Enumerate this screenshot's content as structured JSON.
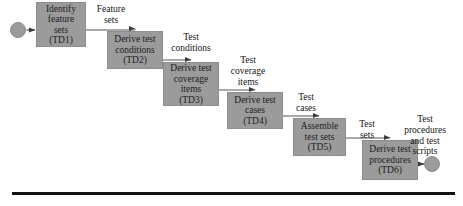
{
  "diagram": {
    "type": "flowchart-staircase",
    "colors": {
      "box_fill": "#9b9b9b",
      "box_border": "#8d8d8d",
      "node_fill": "#9b9b9b",
      "connector": "#555555",
      "text": "#1d1d1d",
      "rule": "#111111",
      "background": "#ffffff"
    },
    "start_node": {
      "name": "start-node",
      "cx": 18,
      "cy": 30,
      "r": 7.5
    },
    "end_node": {
      "name": "end-node",
      "cx": 432,
      "cy": 164,
      "r": 7.5
    },
    "boxes": [
      {
        "id": "TD1",
        "lines": [
          "Identify",
          "feature",
          "sets",
          "(TD1)"
        ],
        "x": 36,
        "y": 2,
        "w": 50,
        "h": 45
      },
      {
        "id": "TD2",
        "lines": [
          "Derive test",
          "conditions",
          "(TD2)"
        ],
        "x": 107,
        "y": 31,
        "w": 56,
        "h": 38
      },
      {
        "id": "TD3",
        "lines": [
          "Derive test",
          "coverage",
          "items",
          "(TD3)"
        ],
        "x": 163,
        "y": 62,
        "w": 56,
        "h": 44
      },
      {
        "id": "TD4",
        "lines": [
          "Derive test",
          "cases",
          "(TD4)"
        ],
        "x": 227,
        "y": 92,
        "w": 56,
        "h": 37
      },
      {
        "id": "TD5",
        "lines": [
          "Assemble",
          "test sets",
          "(TD5)"
        ],
        "x": 293,
        "y": 118,
        "w": 53,
        "h": 38
      },
      {
        "id": "TD6",
        "lines": [
          "Derive test",
          "procedures",
          "(TD6)"
        ],
        "x": 362,
        "y": 140,
        "w": 56,
        "h": 40
      }
    ],
    "edge_labels": [
      {
        "name": "edge-label-feature-sets",
        "lines": [
          "Feature",
          "sets"
        ],
        "x": 88,
        "y": 4,
        "w": 46
      },
      {
        "name": "edge-label-test-conditions",
        "lines": [
          "Test",
          "conditions"
        ],
        "x": 164,
        "y": 32,
        "w": 54
      },
      {
        "name": "edge-label-test-coverage-items",
        "lines": [
          "Test",
          "coverage",
          "items"
        ],
        "x": 224,
        "y": 55,
        "w": 48
      },
      {
        "name": "edge-label-test-cases",
        "lines": [
          "Test",
          "cases"
        ],
        "x": 289,
        "y": 92,
        "w": 34
      },
      {
        "name": "edge-label-test-sets",
        "lines": [
          "Test",
          "sets"
        ],
        "x": 351,
        "y": 119,
        "w": 32
      },
      {
        "name": "edge-label-test-procedures-and-test-scripts",
        "lines": [
          "Test",
          "procedures",
          "and test",
          "scripts"
        ],
        "x": 397,
        "y": 114,
        "w": 56
      }
    ],
    "connectors": [
      {
        "name": "connector-start-to-td1",
        "kind": "straight-arrow",
        "x1": 26,
        "y1": 30,
        "x2": 34,
        "y2": 30
      },
      {
        "name": "connector-td1-to-td2",
        "kind": "elbow-down-arrow",
        "x1": 86,
        "y1": 30,
        "x2": 135,
        "y2": 29
      },
      {
        "name": "connector-td2-to-td3",
        "kind": "elbow-down-arrow",
        "x1": 163,
        "y1": 60,
        "x2": 191,
        "y2": 60
      },
      {
        "name": "connector-td3-to-td4",
        "kind": "elbow-down-arrow",
        "x1": 219,
        "y1": 90,
        "x2": 255,
        "y2": 90
      },
      {
        "name": "connector-td4-to-td5",
        "kind": "elbow-down-arrow",
        "x1": 283,
        "y1": 116,
        "x2": 319,
        "y2": 116
      },
      {
        "name": "connector-td5-to-td6",
        "kind": "elbow-down-arrow",
        "x1": 346,
        "y1": 138,
        "x2": 390,
        "y2": 138
      },
      {
        "name": "connector-td6-to-end",
        "kind": "straight-arrow",
        "x1": 418,
        "y1": 164,
        "x2": 424,
        "y2": 164
      }
    ],
    "bottom_rule": {
      "name": "bottom-rule",
      "x": 12,
      "y": 192,
      "w": 443,
      "h": 3
    }
  }
}
